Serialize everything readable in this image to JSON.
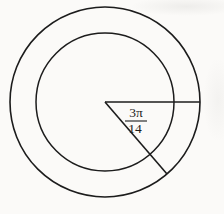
{
  "figure": {
    "type": "concentric-circles-with-sector",
    "angle_label": {
      "numerator": "3π",
      "denominator": "14",
      "value": "3π/14"
    },
    "colors": {
      "line": "#1c1c1c",
      "background": "#fbfaf8"
    }
  }
}
